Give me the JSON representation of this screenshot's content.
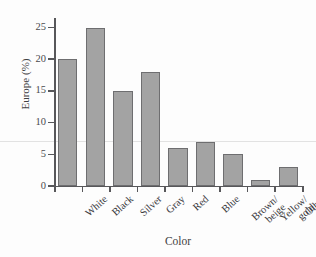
{
  "chart_data": {
    "type": "bar",
    "title": "",
    "xlabel": "Color",
    "ylabel": "Europe (%)",
    "categories": [
      "White",
      "Black",
      "Silver",
      "Gray",
      "Red",
      "Blue",
      "Brown/beige",
      "Yellow/gold",
      "Other"
    ],
    "category_lines": [
      [
        "White"
      ],
      [
        "Black"
      ],
      [
        "Silver"
      ],
      [
        "Gray"
      ],
      [
        "Red"
      ],
      [
        "Blue"
      ],
      [
        "Brown/",
        "beige"
      ],
      [
        "Yellow/",
        "gold"
      ],
      [
        "Other"
      ]
    ],
    "values": [
      20,
      25,
      15,
      18,
      6,
      7,
      5,
      1,
      3
    ],
    "ylim": [
      0,
      26.5
    ],
    "yticks": [
      0,
      5,
      10,
      15,
      20,
      25
    ],
    "ytick_labels": [
      "0",
      "5",
      "10",
      "15",
      "20",
      "25"
    ],
    "grid": false,
    "legend": null,
    "bar_color": "#a3a3a3",
    "bar_edge_color": "#6e6e70",
    "axis_color": "#57575a",
    "background": "#fdfdfd"
  }
}
